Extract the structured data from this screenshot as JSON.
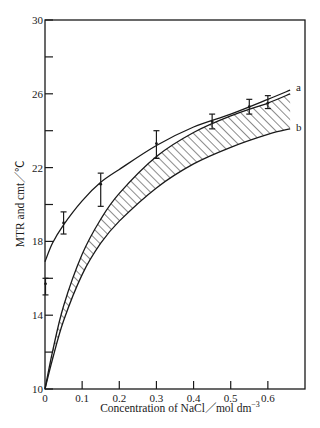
{
  "chart_data": {
    "type": "line",
    "title": "",
    "xlabel": "Concentration of NaCl／mol  dm⁻³",
    "ylabel": "MTR and cmt／℃",
    "xlim": [
      0,
      0.7
    ],
    "ylim": [
      10,
      30
    ],
    "x_ticks": [
      0,
      0.1,
      0.2,
      0.3,
      0.4,
      0.5,
      0.6
    ],
    "x_tick_labels": [
      "0",
      "0.1",
      "0.2",
      "0.3",
      "0.4",
      "0.5",
      "0.6"
    ],
    "y_ticks": [
      10,
      12,
      14,
      16,
      18,
      20,
      22,
      24,
      26,
      28,
      30
    ],
    "y_tick_labels": [
      "10",
      "",
      "14",
      "",
      "18",
      "",
      "22",
      "",
      "26",
      "",
      "30"
    ],
    "grid": false,
    "legend": null,
    "series": [
      {
        "name": "measured points (with error bars)",
        "kind": "scatter-errorbar",
        "x": [
          0,
          0.05,
          0.15,
          0.3,
          0.45,
          0.55,
          0.6
        ],
        "y": [
          15.7,
          19.0,
          21.1,
          23.3,
          24.5,
          25.3,
          25.5
        ],
        "err_low": [
          15.1,
          18.4,
          19.9,
          22.5,
          24.1,
          24.9,
          25.2
        ],
        "err_high": [
          16.0,
          19.6,
          21.7,
          24.0,
          24.9,
          25.7,
          25.9
        ]
      },
      {
        "name": "a",
        "kind": "line",
        "x": [
          0,
          0.02,
          0.05,
          0.1,
          0.15,
          0.2,
          0.3,
          0.4,
          0.5,
          0.6,
          0.66
        ],
        "y": [
          16.9,
          17.9,
          18.9,
          20.2,
          21.2,
          21.9,
          23.2,
          24.2,
          24.9,
          25.7,
          26.2
        ]
      },
      {
        "name": "b",
        "kind": "line",
        "x": [
          0,
          0.02,
          0.05,
          0.1,
          0.15,
          0.2,
          0.3,
          0.4,
          0.5,
          0.6,
          0.66
        ],
        "y": [
          10.0,
          11.6,
          13.7,
          16.2,
          17.9,
          19.1,
          20.9,
          22.2,
          23.1,
          23.8,
          24.1
        ]
      },
      {
        "name": "band upper",
        "kind": "line",
        "x": [
          0,
          0.02,
          0.05,
          0.1,
          0.15,
          0.2,
          0.3,
          0.4,
          0.5,
          0.6,
          0.66
        ],
        "y": [
          10.0,
          12.0,
          14.5,
          17.3,
          19.2,
          20.6,
          22.6,
          23.9,
          24.8,
          25.5,
          26.0
        ]
      }
    ],
    "annotations": [
      {
        "text": "a",
        "x": 0.68,
        "y": 26.4
      },
      {
        "text": "b",
        "x": 0.68,
        "y": 24.2
      },
      {
        "text": "hatched region between band upper and curve b",
        "x": 0.35,
        "y": 22.5
      }
    ]
  },
  "labels": {
    "curve_a": "a",
    "curve_b": "b",
    "x_axis_title": "Concentration of NaCl／mol  dm",
    "x_axis_exponent": "−3",
    "y_axis_title": "MTR and cmt／℃"
  },
  "colors": {
    "ink": "#1a1a1a",
    "background": "#ffffff"
  }
}
